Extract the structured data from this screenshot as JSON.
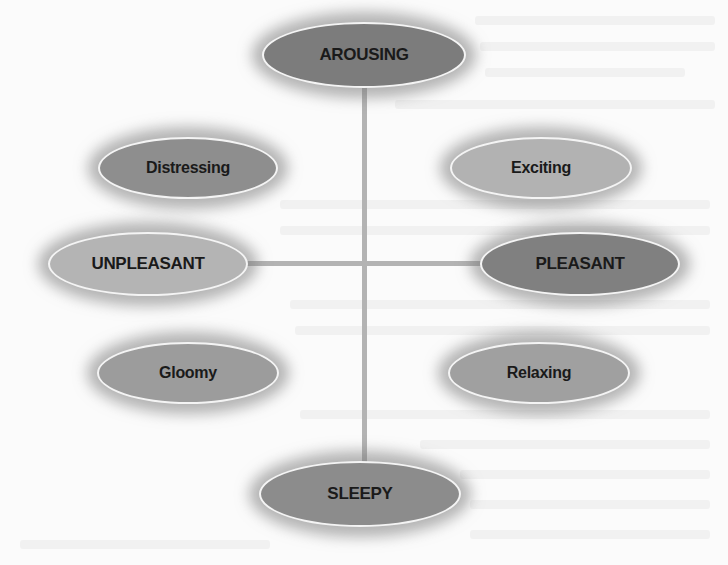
{
  "diagram": {
    "type": "circumplex-of-affect",
    "axes": {
      "vertical": {
        "top": "AROUSING",
        "bottom": "SLEEPY"
      },
      "horizontal": {
        "left": "UNPLEASANT",
        "right": "PLEASANT"
      }
    },
    "nodes": {
      "arousing": {
        "label": "AROUSING",
        "fill": "#7c7c7c"
      },
      "distressing": {
        "label": "Distressing",
        "fill": "#8e8e8e"
      },
      "exciting": {
        "label": "Exciting",
        "fill": "#b2b2b2"
      },
      "unpleasant": {
        "label": "UNPLEASANT",
        "fill": "#b4b4b4"
      },
      "pleasant": {
        "label": "PLEASANT",
        "fill": "#808080"
      },
      "gloomy": {
        "label": "Gloomy",
        "fill": "#9c9c9c"
      },
      "relaxing": {
        "label": "Relaxing",
        "fill": "#a0a0a0"
      },
      "sleepy": {
        "label": "SLEEPY",
        "fill": "#8c8c8c"
      }
    },
    "axis_color": "#b3b3b3"
  }
}
